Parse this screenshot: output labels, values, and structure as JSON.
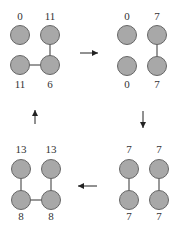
{
  "panels": [
    {
      "name": "panel-top-left",
      "labels": {
        "tl": "0",
        "tr": "11",
        "bl": "11",
        "br": "6"
      },
      "nodes": {
        "tl": [
          20,
          35
        ],
        "tr": [
          50,
          35
        ],
        "bl": [
          20,
          65
        ],
        "br": [
          50,
          65
        ]
      },
      "label_y": {
        "top": 20,
        "bottom": 88
      },
      "edges": [
        [
          "tr",
          "br"
        ],
        [
          "bl",
          "br"
        ]
      ]
    },
    {
      "name": "panel-top-right",
      "labels": {
        "tl": "0",
        "tr": "7",
        "bl": "0",
        "br": "7"
      },
      "nodes": {
        "tl": [
          127,
          35
        ],
        "tr": [
          157,
          35
        ],
        "bl": [
          127,
          66
        ],
        "br": [
          157,
          66
        ]
      },
      "label_y": {
        "top": 20,
        "bottom": 88
      },
      "edges": [
        [
          "tr",
          "br"
        ]
      ]
    },
    {
      "name": "panel-bottom-right",
      "labels": {
        "tl": "7",
        "tr": "7",
        "bl": "7",
        "br": "7"
      },
      "nodes": {
        "tl": [
          129,
          169
        ],
        "tr": [
          159,
          169
        ],
        "bl": [
          129,
          200
        ],
        "br": [
          159,
          200
        ]
      },
      "label_y": {
        "top": 153,
        "bottom": 220
      },
      "edges": [
        [
          "tl",
          "bl"
        ],
        [
          "tr",
          "br"
        ]
      ]
    },
    {
      "name": "panel-bottom-left",
      "labels": {
        "tl": "13",
        "tr": "13",
        "bl": "8",
        "br": "8"
      },
      "nodes": {
        "tl": [
          21,
          169
        ],
        "tr": [
          51,
          169
        ],
        "bl": [
          21,
          200
        ],
        "br": [
          51,
          200
        ]
      },
      "label_y": {
        "top": 153,
        "bottom": 220
      },
      "edges": [
        [
          "tl",
          "bl"
        ],
        [
          "tr",
          "br"
        ],
        [
          "bl",
          "br"
        ]
      ]
    }
  ],
  "arrows": [
    {
      "name": "arrow-right",
      "x1": 80,
      "y1": 53,
      "x2": 98,
      "y2": 53
    },
    {
      "name": "arrow-down",
      "x1": 143,
      "y1": 111,
      "x2": 143,
      "y2": 128
    },
    {
      "name": "arrow-left",
      "x1": 97,
      "y1": 186,
      "x2": 78,
      "y2": 186
    },
    {
      "name": "arrow-up",
      "x1": 35,
      "y1": 124,
      "x2": 35,
      "y2": 110
    }
  ],
  "node_radius": 9.5
}
